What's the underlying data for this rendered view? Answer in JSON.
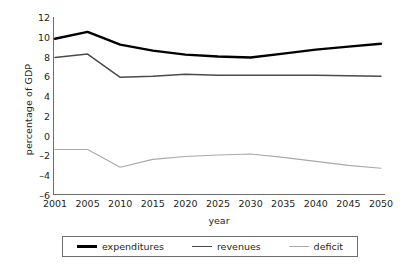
{
  "chart_data": {
    "type": "line",
    "title": "",
    "xlabel": "year",
    "ylabel": "percentage of GDP",
    "x": [
      2001,
      2005,
      2010,
      2015,
      2020,
      2025,
      2030,
      2035,
      2040,
      2045,
      2050
    ],
    "xtick_labels": [
      "2001",
      "2005",
      "2010",
      "2015",
      "2020",
      "2025",
      "2030",
      "2035",
      "2040",
      "2045",
      "2050"
    ],
    "ytick_labels": [
      "12",
      "10",
      "8",
      "6",
      "4",
      "2",
      "0",
      "-2",
      "-4",
      "-6"
    ],
    "ylim": [
      -6,
      12
    ],
    "ytick_step": 2,
    "grid": false,
    "legend_position": "bottom",
    "series": [
      {
        "name": "expenditures",
        "color": "#000000",
        "width": 2.4,
        "values": [
          9.8,
          10.5,
          9.2,
          8.6,
          8.2,
          8.0,
          7.9,
          8.3,
          8.7,
          9.0,
          9.3
        ]
      },
      {
        "name": "revenues",
        "color": "#4a4a4c",
        "width": 1.5,
        "values": [
          7.9,
          8.25,
          5.9,
          6.0,
          6.2,
          6.1,
          6.1,
          6.1,
          6.1,
          6.05,
          6.0
        ]
      },
      {
        "name": "deficit",
        "color": "#a7a9ac",
        "width": 1.1,
        "values": [
          -1.4,
          -1.4,
          -3.2,
          -2.4,
          -2.1,
          -1.95,
          -1.85,
          -2.2,
          -2.6,
          -3.0,
          -3.3
        ]
      }
    ]
  },
  "legend": {
    "items": [
      {
        "label": "expenditures"
      },
      {
        "label": "revenues"
      },
      {
        "label": "deficit"
      }
    ]
  }
}
